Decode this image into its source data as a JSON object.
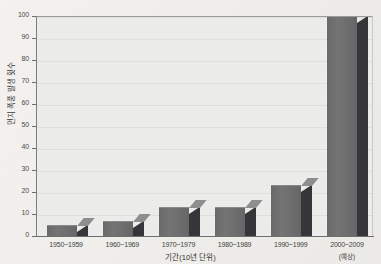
{
  "chart_data": {
    "type": "bar",
    "title": "",
    "xlabel": "기간(10년 단위)",
    "ylabel": "먼지 폭풍 발생 횟수",
    "categories": [
      "1950~1959",
      "1960~1969",
      "1970~1979",
      "1980~1989",
      "1990~1999",
      "2000~2009"
    ],
    "category_notes": [
      "",
      "",
      "",
      "",
      "",
      "(예상)"
    ],
    "values": [
      5,
      7,
      13,
      13,
      23,
      100
    ],
    "ylim": [
      0,
      100
    ],
    "yticks": [
      0,
      10,
      20,
      30,
      40,
      50,
      60,
      70,
      80,
      90,
      100
    ],
    "ytick_labels": [
      "0",
      "10",
      "20",
      "30",
      "40",
      "50",
      "60",
      "70",
      "80",
      "90",
      "100"
    ],
    "grid": true,
    "grid_axis": "y",
    "legend": false,
    "bar_style": "3d",
    "colors": {
      "bar_front": "#6e6e6e",
      "bar_side": "#35353a",
      "bar_top": "#8e8e8e",
      "plot_background": "#ececeb",
      "page_background": "#f2f0ec",
      "gridline": "#dfdfde",
      "axis": "#6d6d6d",
      "text": "#3b3b3b"
    }
  }
}
